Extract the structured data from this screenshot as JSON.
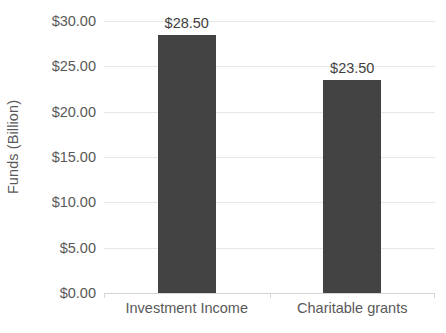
{
  "chart_data": {
    "type": "bar",
    "title": "",
    "xlabel": "",
    "ylabel": "Funds (Billion)",
    "categories": [
      "Investment Income",
      "Charitable grants"
    ],
    "values": [
      28.5,
      23.5
    ],
    "data_labels": [
      "$28.50",
      "$23.50"
    ],
    "ylim": [
      0,
      30
    ],
    "ytick_values": [
      0,
      5,
      10,
      15,
      20,
      25,
      30
    ],
    "ytick_labels": [
      "$0.00",
      "$5.00",
      "$10.00",
      "$15.00",
      "$20.00",
      "$25.00",
      "$30.00"
    ],
    "grid": true,
    "legend": "none",
    "series": [
      {
        "name": "Funds",
        "values": [
          28.5,
          23.5
        ],
        "color": "#434343"
      }
    ],
    "colors": {
      "bar": "#434343",
      "gridline": "#e8e8e8",
      "axis_line": "#d4d4d4",
      "tick_label": "#595959",
      "data_label": "#3f3f3f",
      "background": "#ffffff"
    }
  }
}
